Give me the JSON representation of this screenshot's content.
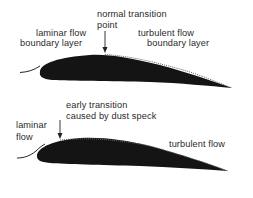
{
  "diagram_1": {
    "title": "normal transition",
    "labels": {
      "transition_line1": "normal transition",
      "transition_line2": "point",
      "laminar_line1": "laminar flow",
      "laminar_line2": "boundary layer",
      "turbulent_line1": "turbulent flow",
      "turbulent_line2": "boundary layer"
    }
  },
  "diagram_2": {
    "labels": {
      "transition_line1": "early transition",
      "transition_line2": "caused by dust speck",
      "laminar_line1": "laminar",
      "laminar_line2": "flow",
      "turbulent": "turbulent flow"
    }
  },
  "colors": {
    "airfoil": "#141414",
    "text": "#2a2a2a",
    "background": "#ffffff"
  }
}
